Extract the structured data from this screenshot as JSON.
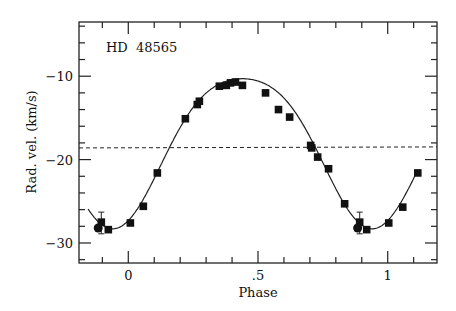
{
  "chart_data": {
    "type": "scatter",
    "title": "",
    "annotation": "HD  48565",
    "xlabel": "Phase",
    "ylabel": "Rad. vel. (km/s)",
    "xlim": [
      -0.19,
      1.19
    ],
    "ylim": [
      -32.4,
      -3.5
    ],
    "x_ticks": [
      {
        "value": 0,
        "label": "0"
      },
      {
        "value": 0.5,
        "label": ".5"
      },
      {
        "value": 1,
        "label": "1"
      }
    ],
    "y_ticks": [
      {
        "value": -10,
        "label": "−10"
      },
      {
        "value": -20,
        "label": "−20"
      },
      {
        "value": -30,
        "label": "−30"
      }
    ],
    "x_minor_step": 0.1,
    "y_minor_step": 2,
    "grid": false,
    "systemic_velocity": -18.6,
    "curve": {
      "type": "orbital-fit",
      "gamma": -18.6,
      "K": 9.0,
      "min_phase": -0.06,
      "description": "solid fitted radial velocity curve"
    },
    "series": [
      {
        "name": "observations",
        "marker": "square",
        "points": [
          [
            -0.104,
            -27.5
          ],
          [
            -0.077,
            -28.4
          ],
          [
            0.008,
            -27.6
          ],
          [
            0.058,
            -25.6
          ],
          [
            0.112,
            -21.6
          ],
          [
            0.22,
            -15.1
          ],
          [
            0.266,
            -13.4
          ],
          [
            0.274,
            -13.0
          ],
          [
            0.351,
            -11.2
          ],
          [
            0.378,
            -11.1
          ],
          [
            0.394,
            -10.8
          ],
          [
            0.413,
            -10.7
          ],
          [
            0.44,
            -11.1
          ],
          [
            0.529,
            -12.0
          ],
          [
            0.579,
            -14.0
          ],
          [
            0.622,
            -14.9
          ],
          [
            0.703,
            -18.3
          ],
          [
            0.707,
            -18.6
          ],
          [
            0.73,
            -19.7
          ],
          [
            0.772,
            -21.1
          ],
          [
            0.834,
            -25.3
          ],
          [
            0.892,
            -27.5
          ],
          [
            0.919,
            -28.4
          ],
          [
            1.004,
            -27.6
          ],
          [
            1.058,
            -25.7
          ],
          [
            1.116,
            -21.6
          ]
        ]
      },
      {
        "name": "observations-circle",
        "marker": "circle",
        "points": [
          [
            -0.116,
            -28.2
          ],
          [
            0.884,
            -28.2
          ]
        ]
      }
    ],
    "error_bars": [
      {
        "x": -0.104,
        "y": -27.5,
        "low": -28.9,
        "high": -26.3
      },
      {
        "x": 0.892,
        "y": -27.5,
        "low": -28.9,
        "high": -26.3
      }
    ]
  }
}
